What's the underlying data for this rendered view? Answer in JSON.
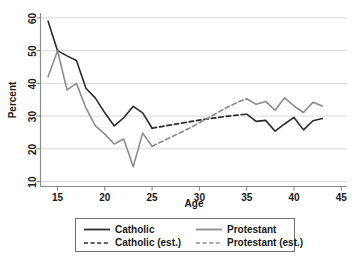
{
  "chart_data": {
    "type": "line",
    "title": "",
    "xlabel": "Age",
    "ylabel": "Percent",
    "xlim": [
      13.2,
      45.6
    ],
    "ylim": [
      8.5,
      61.5
    ],
    "xticks": [
      15,
      20,
      25,
      30,
      35,
      40,
      45
    ],
    "yticks": [
      10,
      20,
      30,
      40,
      50,
      60
    ],
    "grid": "horizontal",
    "legend_position": "below-plot",
    "colors": {
      "catholic": "#2b2b2b",
      "protestant": "#8c8c8c",
      "catholic_est": "#2b2b2b",
      "protestant_est": "#8c8c8c",
      "gridline": "#d8d8d8",
      "axis": "#8a8a8a",
      "background": "#ffffff"
    },
    "series": [
      {
        "name": "Catholic",
        "style": "solid",
        "color": "#2b2b2b",
        "x": [
          14,
          15,
          16,
          17,
          18,
          19,
          20,
          21,
          22,
          23,
          24,
          25
        ],
        "values": [
          59.0,
          50.0,
          48.4,
          47.0,
          38.5,
          35.5,
          31.0,
          27.0,
          29.5,
          33.0,
          31.0,
          26.3
        ]
      },
      {
        "name": "Catholic (est.)",
        "style": "dashed",
        "color": "#2b2b2b",
        "x": [
          25,
          26,
          27,
          28,
          29,
          30,
          31,
          32,
          33,
          34,
          35
        ],
        "values": [
          26.3,
          26.8,
          27.3,
          27.8,
          28.3,
          28.8,
          29.2,
          29.6,
          30.0,
          30.3,
          30.6
        ]
      },
      {
        "name": "Protestant",
        "style": "solid",
        "color": "#8c8c8c",
        "x": [
          14,
          15,
          16,
          17,
          18,
          19,
          20,
          21,
          22,
          23,
          24,
          25
        ],
        "values": [
          42.0,
          50.0,
          38.0,
          40.0,
          32.5,
          27.0,
          24.5,
          21.5,
          23.0,
          14.5,
          24.8,
          20.8
        ]
      },
      {
        "name": "Protestant (est.)",
        "style": "dashed",
        "color": "#8c8c8c",
        "x": [
          25,
          26,
          27,
          28,
          29,
          30,
          31,
          32,
          33,
          34,
          35
        ],
        "values": [
          20.8,
          22.2,
          23.6,
          25.0,
          26.4,
          28.0,
          29.6,
          31.2,
          32.8,
          34.2,
          35.3
        ]
      },
      {
        "name": "Catholic",
        "style": "solid",
        "color": "#2b2b2b",
        "x": [
          35,
          36,
          37,
          38,
          39,
          40,
          41,
          42,
          43
        ],
        "values": [
          30.6,
          28.4,
          28.7,
          25.4,
          27.6,
          29.6,
          25.8,
          28.6,
          29.3
        ]
      },
      {
        "name": "Protestant",
        "style": "solid",
        "color": "#8c8c8c",
        "x": [
          35,
          36,
          37,
          38,
          39,
          40,
          41,
          42,
          43
        ],
        "values": [
          35.3,
          33.6,
          34.5,
          31.8,
          35.6,
          33.1,
          31.1,
          34.2,
          33.1
        ]
      }
    ],
    "legend": [
      {
        "label": "Catholic",
        "style": "solid",
        "color": "#2b2b2b"
      },
      {
        "label": "Protestant",
        "style": "solid",
        "color": "#8c8c8c"
      },
      {
        "label": "Catholic (est.)",
        "style": "dashed",
        "color": "#2b2b2b"
      },
      {
        "label": "Protestant (est.)",
        "style": "dashed",
        "color": "#8c8c8c"
      }
    ]
  }
}
